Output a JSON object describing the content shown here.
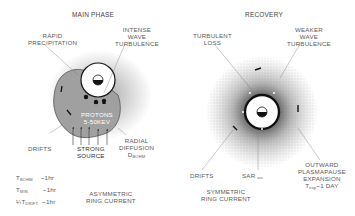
{
  "left_panel": {
    "title": "MAIN PHASE",
    "labels": {
      "rapid_precipitation": [
        "RAPID",
        "PRECIPITATION"
      ],
      "intense_wave": [
        "INTENSE",
        "WAVE",
        "TURBULENCE"
      ],
      "protons": [
        "PROTONS",
        "5-50KEV"
      ],
      "drifts": "DRIFTS",
      "strong_source": [
        "STRONG",
        "SOURCE"
      ],
      "radial_diffusion": [
        "RADIAL",
        "DIFFUSION"
      ],
      "d_bohm": "D",
      "d_bohm_sub": "BOHM"
    },
    "timescales": [
      {
        "prefix": "",
        "symbol": "T",
        "sub": "BOHM",
        "value": "~1hr"
      },
      {
        "prefix": "",
        "symbol": "T",
        "sub": "MIN",
        "value": "~1hr"
      },
      {
        "prefix": "¼",
        "symbol": "T",
        "sub": "DRIFT",
        "value": "~1hr"
      }
    ],
    "caption": [
      "ASYMMETRIC",
      "RING CURRENT"
    ]
  },
  "right_panel": {
    "title": "RECOVERY",
    "labels": {
      "turbulent_loss": [
        "TURBULENT",
        "LOSS"
      ],
      "weaker_wave": [
        "WEAKER",
        "WAVE",
        "TURBULENCE"
      ],
      "drifts": "DRIFTS",
      "sar": "SAR",
      "sar_sub": "arc",
      "outward": [
        "OUTWARD",
        "PLASMAPAUSE",
        "EXPANSION"
      ],
      "exp_symbol": "T",
      "exp_sub": "exp",
      "exp_value": "~1 DAY"
    },
    "caption": [
      "SYMMETRIC",
      "RING CURRENT"
    ]
  },
  "colors": {
    "ink": "#111111",
    "blob": "#9a9a9a",
    "stipple": "#777777",
    "text": "#5a5a5a"
  }
}
